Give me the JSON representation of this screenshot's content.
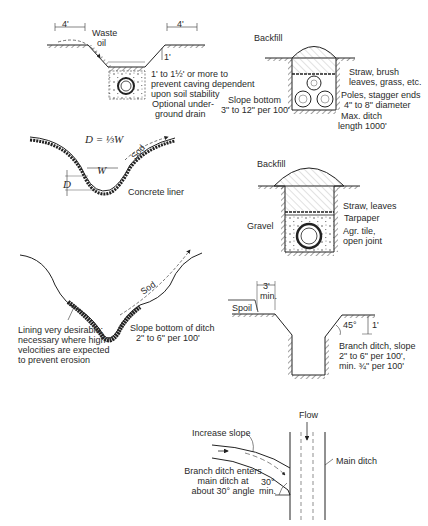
{
  "panels": {
    "v_ditch": {
      "dim_left": "4'",
      "dim_right": "4'",
      "waste_oil": [
        "Waste",
        "oil"
      ],
      "rise": "1'",
      "slope_note": [
        "1' to 1½' or more to",
        "prevent caving dependent",
        "upon soil stability"
      ],
      "drain_note": [
        "Optional under-",
        "ground drain"
      ]
    },
    "pole_drain": {
      "backfill": "Backfill",
      "straw": [
        "Straw, brush",
        "leaves, grass, etc."
      ],
      "poles": [
        "Poles, stagger ends",
        "4\" to 8\" diameter"
      ],
      "max_len": [
        "Max. ditch",
        "length 1000'"
      ],
      "slope": [
        "Slope bottom",
        "3\" to 12\" per 100'"
      ]
    },
    "concrete_ditch": {
      "formula": "D = ⅓W",
      "width": "W",
      "depth": "D",
      "sod": "Sod",
      "liner": "Concrete liner"
    },
    "tile_drain": {
      "backfill": "Backfill",
      "straw": "Straw, leaves",
      "tarpaper": "Tarpaper",
      "gravel": "Gravel",
      "tile": [
        "Agr. tile,",
        "open joint"
      ]
    },
    "lined_ditch": {
      "sod": "Sod",
      "lining": [
        "Lining very desirable;",
        "necessary where high",
        "velocities are expected",
        "to prevent erosion"
      ],
      "slope": [
        "Slope bottom of ditch",
        "2\" to 6\" per 100'"
      ]
    },
    "branch_ditch": {
      "setback": [
        "3'",
        "min."
      ],
      "spoil": "Spoil",
      "angle": "45°",
      "rise": "1'",
      "note": [
        "Branch ditch, slope",
        "2\" to 6\" per 100',",
        "min. ¾\" per 100'"
      ]
    },
    "junction_plan": {
      "flow": "Flow",
      "increase_slope": "Increase slope",
      "main_ditch": "Main ditch",
      "branch_note": [
        "Branch ditch enters",
        "main ditch at",
        "about 30° angle"
      ],
      "angle": [
        "30°",
        "min."
      ]
    }
  }
}
